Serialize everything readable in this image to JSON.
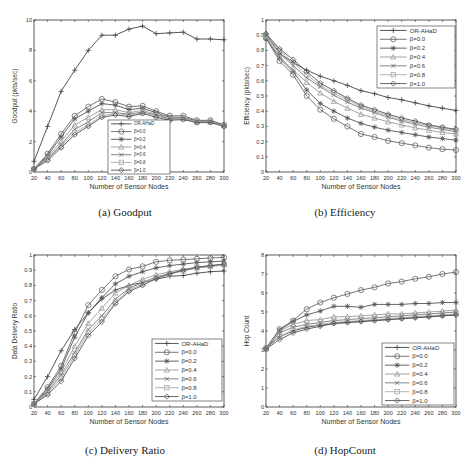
{
  "figure": {
    "captions": [
      "(a) Goodput",
      "(b) Efficiency",
      "(c) Delivery Ratio",
      "(d) HopCount"
    ]
  },
  "legend_labels": [
    "OR-AHaD",
    "β=0.0",
    "β=0.2",
    "β=0.4",
    "β=0.6",
    "β=0.8",
    "β=1.0"
  ],
  "chart_data": [
    {
      "type": "line",
      "title": "(a) Goodput",
      "xlabel": "Number of Sensor Nodes",
      "ylabel": "Goodput (pkts/sec)",
      "x": [
        20,
        40,
        60,
        80,
        100,
        120,
        140,
        160,
        180,
        200,
        220,
        240,
        260,
        280,
        300
      ],
      "xticks": [
        20,
        40,
        60,
        80,
        100,
        120,
        140,
        160,
        180,
        200,
        220,
        240,
        260,
        280,
        300
      ],
      "ylim": [
        0,
        10
      ],
      "yticks": [
        0,
        2,
        4,
        6,
        8,
        10
      ],
      "legend_position": "lower center",
      "series": [
        {
          "name": "OR-AHaD",
          "marker": "plus",
          "values": [
            0.7,
            3.0,
            5.3,
            6.7,
            8.0,
            9.0,
            9.0,
            9.4,
            9.6,
            9.1,
            9.15,
            9.2,
            8.75,
            8.75,
            8.7
          ]
        },
        {
          "name": "β=0.0",
          "marker": "circle",
          "values": [
            0.2,
            1.2,
            2.5,
            3.7,
            4.3,
            4.8,
            4.6,
            4.3,
            4.35,
            4.0,
            3.7,
            3.7,
            3.4,
            3.4,
            3.1
          ]
        },
        {
          "name": "β=0.2",
          "marker": "star",
          "values": [
            0.2,
            1.1,
            2.3,
            3.5,
            4.0,
            4.5,
            4.4,
            4.1,
            4.2,
            3.9,
            3.6,
            3.6,
            3.35,
            3.35,
            3.1
          ]
        },
        {
          "name": "β=0.4",
          "marker": "triangle",
          "values": [
            0.2,
            1.0,
            2.0,
            3.1,
            3.6,
            4.1,
            4.1,
            3.9,
            4.05,
            3.8,
            3.55,
            3.55,
            3.3,
            3.3,
            3.05
          ]
        },
        {
          "name": "β=0.6",
          "marker": "x",
          "values": [
            0.2,
            0.9,
            1.8,
            2.8,
            3.3,
            3.9,
            3.9,
            3.8,
            3.95,
            3.75,
            3.5,
            3.5,
            3.3,
            3.3,
            3.05
          ]
        },
        {
          "name": "β=0.8",
          "marker": "square",
          "values": [
            0.2,
            0.85,
            1.7,
            2.6,
            3.1,
            3.7,
            3.85,
            3.75,
            3.9,
            3.7,
            3.45,
            3.5,
            3.3,
            3.3,
            3.05
          ]
        },
        {
          "name": "β=1.0",
          "marker": "diamond",
          "values": [
            0.2,
            0.75,
            1.6,
            2.45,
            3.0,
            3.6,
            3.75,
            3.65,
            3.85,
            3.6,
            3.4,
            3.45,
            3.25,
            3.25,
            3.0
          ]
        }
      ]
    },
    {
      "type": "line",
      "title": "(b) Efficiency",
      "xlabel": "Number of Sensor Nodes",
      "ylabel": "Efficiency (pkts/sec)",
      "x": [
        20,
        40,
        60,
        80,
        100,
        120,
        140,
        160,
        180,
        200,
        220,
        240,
        260,
        280,
        300
      ],
      "xticks": [
        20,
        40,
        60,
        80,
        100,
        120,
        140,
        160,
        180,
        200,
        220,
        240,
        260,
        280,
        300
      ],
      "ylim": [
        0,
        1
      ],
      "yticks": [
        0,
        0.1,
        0.2,
        0.3,
        0.4,
        0.5,
        0.6,
        0.7,
        0.8,
        0.9,
        1
      ],
      "legend_position": "upper right",
      "series": [
        {
          "name": "OR-AHaD",
          "marker": "plus",
          "values": [
            0.91,
            0.78,
            0.72,
            0.67,
            0.63,
            0.6,
            0.57,
            0.535,
            0.515,
            0.49,
            0.475,
            0.455,
            0.435,
            0.42,
            0.405
          ]
        },
        {
          "name": "β=0.0",
          "marker": "circle",
          "values": [
            0.88,
            0.73,
            0.64,
            0.5,
            0.41,
            0.35,
            0.3,
            0.25,
            0.23,
            0.205,
            0.19,
            0.175,
            0.16,
            0.15,
            0.145
          ]
        },
        {
          "name": "β=0.2",
          "marker": "star",
          "values": [
            0.88,
            0.75,
            0.66,
            0.54,
            0.45,
            0.4,
            0.355,
            0.32,
            0.295,
            0.275,
            0.26,
            0.245,
            0.23,
            0.22,
            0.21
          ]
        },
        {
          "name": "β=0.4",
          "marker": "triangle",
          "values": [
            0.89,
            0.76,
            0.67,
            0.59,
            0.52,
            0.465,
            0.42,
            0.38,
            0.355,
            0.33,
            0.31,
            0.29,
            0.275,
            0.26,
            0.25
          ]
        },
        {
          "name": "β=0.6",
          "marker": "x",
          "values": [
            0.9,
            0.78,
            0.7,
            0.62,
            0.56,
            0.505,
            0.46,
            0.42,
            0.39,
            0.36,
            0.335,
            0.315,
            0.295,
            0.28,
            0.265
          ]
        },
        {
          "name": "β=0.8",
          "marker": "square",
          "values": [
            0.9,
            0.8,
            0.72,
            0.64,
            0.57,
            0.52,
            0.475,
            0.43,
            0.4,
            0.37,
            0.345,
            0.325,
            0.305,
            0.29,
            0.275
          ]
        },
        {
          "name": "β=1.0",
          "marker": "diamond",
          "values": [
            0.91,
            0.81,
            0.74,
            0.66,
            0.585,
            0.535,
            0.485,
            0.44,
            0.41,
            0.38,
            0.355,
            0.335,
            0.31,
            0.295,
            0.28
          ]
        }
      ]
    },
    {
      "type": "line",
      "title": "(c) Delivery Ratio",
      "xlabel": "Number of Sensor Nodes",
      "ylabel": "Data Delivery Ratio",
      "x": [
        20,
        40,
        60,
        80,
        100,
        120,
        140,
        160,
        180,
        200,
        220,
        240,
        260,
        280,
        300
      ],
      "xticks": [
        20,
        40,
        60,
        80,
        100,
        120,
        140,
        160,
        180,
        200,
        220,
        240,
        260,
        280,
        300
      ],
      "ylim": [
        0,
        1
      ],
      "yticks": [
        0,
        0.1,
        0.2,
        0.3,
        0.4,
        0.5,
        0.6,
        0.7,
        0.8,
        0.9,
        1
      ],
      "legend_position": "lower right",
      "series": [
        {
          "name": "OR-AHaD",
          "marker": "plus",
          "values": [
            0.05,
            0.2,
            0.37,
            0.51,
            0.62,
            0.71,
            0.77,
            0.8,
            0.82,
            0.84,
            0.86,
            0.865,
            0.88,
            0.89,
            0.895
          ]
        },
        {
          "name": "β=0.0",
          "marker": "circle",
          "values": [
            0.02,
            0.13,
            0.27,
            0.49,
            0.67,
            0.77,
            0.86,
            0.905,
            0.925,
            0.955,
            0.965,
            0.97,
            0.975,
            0.98,
            0.985
          ]
        },
        {
          "name": "β=0.2",
          "marker": "star",
          "values": [
            0.02,
            0.12,
            0.25,
            0.46,
            0.62,
            0.72,
            0.81,
            0.86,
            0.89,
            0.915,
            0.93,
            0.94,
            0.95,
            0.955,
            0.96
          ]
        },
        {
          "name": "β=0.4",
          "marker": "triangle",
          "values": [
            0.02,
            0.11,
            0.23,
            0.4,
            0.55,
            0.65,
            0.75,
            0.8,
            0.84,
            0.87,
            0.89,
            0.905,
            0.92,
            0.93,
            0.94
          ]
        },
        {
          "name": "β=0.6",
          "marker": "x",
          "values": [
            0.02,
            0.1,
            0.21,
            0.36,
            0.51,
            0.6,
            0.71,
            0.78,
            0.82,
            0.855,
            0.88,
            0.9,
            0.915,
            0.925,
            0.935
          ]
        },
        {
          "name": "β=0.8",
          "marker": "square",
          "values": [
            0.02,
            0.09,
            0.19,
            0.34,
            0.49,
            0.58,
            0.69,
            0.77,
            0.81,
            0.85,
            0.875,
            0.895,
            0.915,
            0.925,
            0.935
          ]
        },
        {
          "name": "β=1.0",
          "marker": "diamond",
          "values": [
            0.02,
            0.08,
            0.17,
            0.32,
            0.47,
            0.56,
            0.68,
            0.76,
            0.8,
            0.845,
            0.875,
            0.9,
            0.92,
            0.93,
            0.94
          ]
        }
      ]
    },
    {
      "type": "line",
      "title": "(d) HopCount",
      "xlabel": "Number of Sensor Nodes",
      "ylabel": "Hop Count",
      "x": [
        20,
        40,
        60,
        80,
        100,
        120,
        140,
        160,
        180,
        200,
        220,
        240,
        260,
        280,
        300
      ],
      "xticks": [
        20,
        40,
        60,
        80,
        100,
        120,
        140,
        160,
        180,
        200,
        220,
        240,
        260,
        280,
        300
      ],
      "ylim": [
        0,
        8
      ],
      "yticks": [
        0,
        1,
        2,
        3,
        4,
        5,
        6,
        7,
        8
      ],
      "legend_position": "lower right",
      "series": [
        {
          "name": "OR-AHaD",
          "marker": "plus",
          "values": [
            3.1,
            3.7,
            4.0,
            4.2,
            4.3,
            4.4,
            4.45,
            4.5,
            4.55,
            4.6,
            4.65,
            4.7,
            4.75,
            4.8,
            4.85
          ]
        },
        {
          "name": "β=0.0",
          "marker": "circle",
          "values": [
            3.1,
            4.1,
            4.55,
            5.15,
            5.5,
            5.75,
            5.95,
            6.15,
            6.3,
            6.5,
            6.6,
            6.75,
            6.85,
            7.0,
            7.1
          ]
        },
        {
          "name": "β=0.2",
          "marker": "star",
          "values": [
            3.1,
            4.05,
            4.5,
            4.85,
            5.05,
            5.3,
            5.3,
            5.25,
            5.4,
            5.4,
            5.4,
            5.45,
            5.45,
            5.5,
            5.5
          ]
        },
        {
          "name": "β=0.4",
          "marker": "triangle",
          "values": [
            3.1,
            4.0,
            4.35,
            4.55,
            4.6,
            4.75,
            4.75,
            4.8,
            4.85,
            4.9,
            4.9,
            4.95,
            5.0,
            5.05,
            5.1
          ]
        },
        {
          "name": "β=0.6",
          "marker": "x",
          "values": [
            3.05,
            3.9,
            4.2,
            4.35,
            4.45,
            4.55,
            4.6,
            4.65,
            4.7,
            4.75,
            4.8,
            4.85,
            4.9,
            4.95,
            5.0
          ]
        },
        {
          "name": "β=0.8",
          "marker": "square",
          "values": [
            3.05,
            3.7,
            4.05,
            4.25,
            4.35,
            4.45,
            4.5,
            4.55,
            4.6,
            4.65,
            4.7,
            4.75,
            4.8,
            4.85,
            4.9
          ]
        },
        {
          "name": "β=1.0",
          "marker": "diamond",
          "values": [
            3.05,
            3.55,
            3.9,
            4.1,
            4.25,
            4.4,
            4.45,
            4.5,
            4.55,
            4.6,
            4.65,
            4.7,
            4.75,
            4.8,
            4.85
          ]
        }
      ]
    }
  ]
}
